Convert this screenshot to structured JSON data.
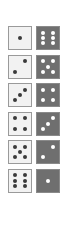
{
  "dice_pairs": [
    {
      "left": 1,
      "right": 6
    },
    {
      "left": 2,
      "right": 5
    },
    {
      "left": 3,
      "right": 4
    },
    {
      "left": 4,
      "right": 3
    },
    {
      "left": 5,
      "right": 2
    },
    {
      "left": 6,
      "right": 1
    }
  ],
  "colors": {
    "light_face": "#f2f2f2",
    "light_pip": "#3a3a3a",
    "dark_face": "#6f6f6f",
    "dark_pip": "#ffffff"
  }
}
